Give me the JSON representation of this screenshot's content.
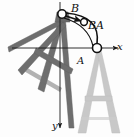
{
  "figure": {
    "type": "engineering-mechanics-diagram",
    "background_color": "#fdfdfd"
  },
  "axes": {
    "x_label": "x",
    "y_label": "y",
    "x_direction": "right",
    "y_direction": "down",
    "origin": {
      "x": 60,
      "y": 48
    },
    "x_end": {
      "x": 120,
      "y": 48
    },
    "y_end": {
      "x": 60,
      "y": 130
    },
    "color": "#1a1a1a",
    "line_width": 0.9
  },
  "points": [
    {
      "name": "B",
      "label": "B",
      "x": 62,
      "y": 14,
      "marker": "open-circle",
      "radius": 4.2,
      "label_offset": {
        "x": 9,
        "y": -11
      }
    },
    {
      "name": "A",
      "label": "A",
      "x": 97,
      "y": 48,
      "marker": "open-circle",
      "radius": 4.5,
      "label_offset": {
        "x": -20,
        "y": 8
      }
    }
  ],
  "vector": {
    "label": "BA",
    "from": "B",
    "to": "midpoint-marker",
    "arrow_tip": {
      "x": 84,
      "y": 22
    },
    "marker": {
      "x": 84,
      "y": 22,
      "radius": 3.4
    },
    "color": "#111111"
  },
  "arcs": [
    {
      "name": "motion-arc-outer",
      "from": {
        "x": 66,
        "y": 13
      },
      "to": {
        "x": 97,
        "y": 45
      },
      "control": {
        "x": 99,
        "y": 14
      },
      "color": "#111111",
      "width": 1.6
    },
    {
      "name": "motion-arc-inner",
      "from": {
        "x": 64,
        "y": 18
      },
      "to": {
        "x": 93,
        "y": 47
      },
      "control": {
        "x": 86,
        "y": 24
      },
      "color": "#111111",
      "width": 1.1
    }
  ],
  "ladders": [
    {
      "name": "ladder-final-upright",
      "state": "final position",
      "color": "#c8c8c8",
      "orientation": "upright",
      "apex": {
        "x": 97,
        "y": 48
      }
    },
    {
      "name": "ladder-initial-rotated",
      "state": "initial position",
      "color": "#6e6e6e",
      "orientation": "rotated",
      "apex": {
        "x": 62,
        "y": 14
      }
    }
  ],
  "colors": {
    "ladder_light": "#c8c8c8",
    "ladder_light_edge": "#bdbdbd",
    "ladder_dark": "#6e6e6e",
    "ladder_dark_edge": "#5f5f5f",
    "axis": "#1a1a1a",
    "text": "#111111"
  }
}
